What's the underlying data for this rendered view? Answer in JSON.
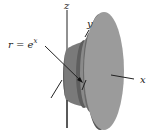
{
  "figure": {
    "type": "solid-of-revolution",
    "labels": {
      "z_axis": "z",
      "y_axis": "y",
      "x_axis": "x",
      "curve_lhs": "r = e",
      "curve_exp": "x"
    },
    "colors": {
      "background": "#ffffff",
      "disk_face": "#9b9b9b",
      "disk_rim": "#5a5a5a",
      "mid_band_light": "#8e8e8e",
      "mid_band_dark": "#6a6a6a",
      "left_body": "#777777",
      "axis_line": "#222222"
    }
  }
}
